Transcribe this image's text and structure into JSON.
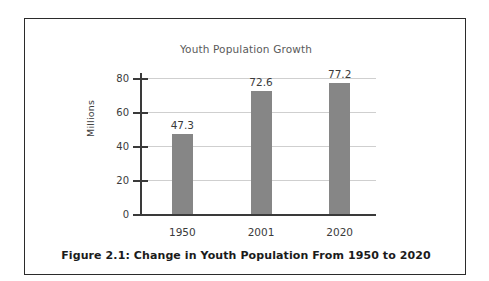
{
  "figure": {
    "caption": "Figure 2.1: Change in Youth Population From 1950 to 2020",
    "border_color": "#2b2b2b",
    "background_color": "#ffffff"
  },
  "chart_data": {
    "type": "bar",
    "title": "Youth Population Growth",
    "categories": [
      "1950",
      "2001",
      "2020"
    ],
    "values": [
      47.3,
      72.6,
      77.2
    ],
    "value_labels": [
      "47.3",
      "72.6",
      "77.2"
    ],
    "xlabel": "",
    "ylabel": "Millions",
    "ylim": [
      0,
      80
    ],
    "yticks": [
      0,
      20,
      40,
      60,
      80
    ],
    "ytick_labels": [
      "0",
      "20",
      "40",
      "60",
      "80"
    ],
    "grid": true,
    "grid_axis": "y",
    "legend": false,
    "bar_color": "#868686",
    "axis_color": "#3a3a3a",
    "grid_color": "#cfcfcf",
    "text_color": "#3b3b3b",
    "title_color": "#5a5a5a"
  }
}
